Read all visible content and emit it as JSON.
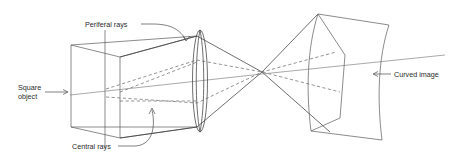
{
  "figure": {
    "type": "optics-ray-diagram",
    "title": "",
    "background_color": "#ffffff",
    "line_color": "#5a5a5a",
    "text_color": "#2b2b2b",
    "width": 456,
    "height": 159
  },
  "labels": {
    "peripheral_rays": "Periferal rays",
    "square_object_line1": "Square",
    "square_object_line2": "object",
    "central_rays": "Central rays",
    "curved_image": "Curved image"
  },
  "elements": {
    "object_name": "square-object-plane",
    "lens_name": "biconvex-lens",
    "image_name": "curved-image-surface",
    "axis_name": "optical-axis"
  }
}
